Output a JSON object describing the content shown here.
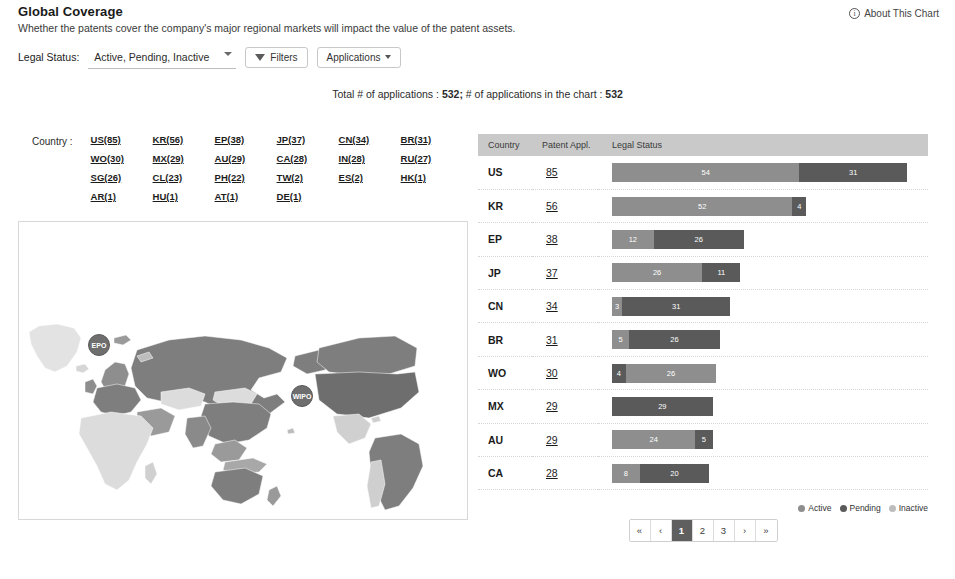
{
  "header": {
    "title": "Global Coverage",
    "subtitle": "Whether the patents cover the company's major regional markets will impact the value of the patent assets.",
    "about_label": "About This Chart",
    "info_glyph": "i"
  },
  "filters": {
    "legal_status_label": "Legal Status:",
    "legal_status_value": "Active, Pending, Inactive",
    "legal_status_options": [
      "Active, Pending, Inactive",
      "Active",
      "Pending",
      "Inactive"
    ],
    "filters_button": "Filters",
    "applications_button": "Applications"
  },
  "totals": {
    "text_prefix": "Total # of applications :",
    "total_applications": "532;",
    "text_middle": "# of applications in the chart :",
    "chart_applications": "532"
  },
  "country_list": {
    "label": "Country :",
    "items": [
      "US(85)",
      "KR(56)",
      "EP(38)",
      "JP(37)",
      "CN(34)",
      "BR(31)",
      "WO(30)",
      "MX(29)",
      "AU(29)",
      "CA(28)",
      "IN(28)",
      "RU(27)",
      "SG(26)",
      "CL(23)",
      "PH(22)",
      "TW(2)",
      "ES(2)",
      "HK(1)",
      "AR(1)",
      "HU(1)",
      "AT(1)",
      "DE(1)"
    ]
  },
  "map": {
    "badges": [
      {
        "name": "epo-badge",
        "label": "EPO"
      },
      {
        "name": "wipo-badge",
        "label": "WIPO"
      }
    ]
  },
  "table": {
    "columns": [
      "Country",
      "Patent Appl.",
      "Legal Status"
    ],
    "rows": [
      {
        "country": "US",
        "appl": "85",
        "segments": [
          {
            "status": "Active",
            "value": 54
          },
          {
            "status": "Pending",
            "value": 31
          }
        ]
      },
      {
        "country": "KR",
        "appl": "56",
        "segments": [
          {
            "status": "Active",
            "value": 52
          },
          {
            "status": "Pending",
            "value": 4
          }
        ]
      },
      {
        "country": "EP",
        "appl": "38",
        "segments": [
          {
            "status": "Active",
            "value": 12
          },
          {
            "status": "Pending",
            "value": 26
          }
        ]
      },
      {
        "country": "JP",
        "appl": "37",
        "segments": [
          {
            "status": "Active",
            "value": 26
          },
          {
            "status": "Pending",
            "value": 11
          }
        ]
      },
      {
        "country": "CN",
        "appl": "34",
        "segments": [
          {
            "status": "Active",
            "value": 3
          },
          {
            "status": "Pending",
            "value": 31
          }
        ]
      },
      {
        "country": "BR",
        "appl": "31",
        "segments": [
          {
            "status": "Active",
            "value": 5
          },
          {
            "status": "Pending",
            "value": 26
          }
        ]
      },
      {
        "country": "WO",
        "appl": "30",
        "segments": [
          {
            "status": "Pending",
            "value": 4
          },
          {
            "status": "Active",
            "value": 26
          }
        ]
      },
      {
        "country": "MX",
        "appl": "29",
        "segments": [
          {
            "status": "Pending",
            "value": 29
          }
        ]
      },
      {
        "country": "AU",
        "appl": "29",
        "segments": [
          {
            "status": "Active",
            "value": 24
          },
          {
            "status": "Pending",
            "value": 5
          }
        ]
      },
      {
        "country": "CA",
        "appl": "28",
        "segments": [
          {
            "status": "Active",
            "value": 8
          },
          {
            "status": "Pending",
            "value": 20
          }
        ]
      }
    ]
  },
  "legend": {
    "items": [
      {
        "label": "Active",
        "color": "#8e8e8e"
      },
      {
        "label": "Pending",
        "color": "#5a5a5a"
      },
      {
        "label": "Inactive",
        "color": "#bdbdbd"
      }
    ]
  },
  "pagination": {
    "buttons": [
      {
        "label": "«",
        "name": "page-first",
        "active": false
      },
      {
        "label": "‹",
        "name": "page-prev",
        "active": false
      },
      {
        "label": "1",
        "name": "page-1",
        "active": true
      },
      {
        "label": "2",
        "name": "page-2",
        "active": false
      },
      {
        "label": "3",
        "name": "page-3",
        "active": false
      },
      {
        "label": "›",
        "name": "page-next",
        "active": false
      },
      {
        "label": "»",
        "name": "page-last",
        "active": false
      }
    ]
  },
  "chart_data": {
    "type": "bar",
    "title": "Global Coverage",
    "subtitle": "Patent applications by country and legal status",
    "orientation": "horizontal",
    "stacked": true,
    "categories": [
      "US",
      "KR",
      "EP",
      "JP",
      "CN",
      "BR",
      "WO",
      "MX",
      "AU",
      "CA"
    ],
    "totals": [
      85,
      56,
      38,
      37,
      34,
      31,
      30,
      29,
      29,
      28
    ],
    "series": [
      {
        "name": "Active",
        "color": "#8e8e8e",
        "values": [
          54,
          52,
          12,
          26,
          3,
          5,
          26,
          0,
          24,
          8
        ]
      },
      {
        "name": "Pending",
        "color": "#5a5a5a",
        "values": [
          31,
          4,
          26,
          11,
          31,
          26,
          4,
          29,
          5,
          20
        ]
      },
      {
        "name": "Inactive",
        "color": "#bdbdbd",
        "values": [
          0,
          0,
          0,
          0,
          0,
          0,
          0,
          0,
          0,
          0
        ]
      }
    ],
    "xlabel": "Patent Applications",
    "ylabel": "Country",
    "xlim": [
      0,
      85
    ],
    "grid": false,
    "legend_position": "bottom-right",
    "all_countries": {
      "US": 85,
      "KR": 56,
      "EP": 38,
      "JP": 37,
      "CN": 34,
      "BR": 31,
      "WO": 30,
      "MX": 29,
      "AU": 29,
      "CA": 28,
      "IN": 28,
      "RU": 27,
      "SG": 26,
      "CL": 23,
      "PH": 22,
      "TW": 2,
      "ES": 2,
      "HK": 1,
      "AR": 1,
      "HU": 1,
      "AT": 1,
      "DE": 1
    }
  }
}
